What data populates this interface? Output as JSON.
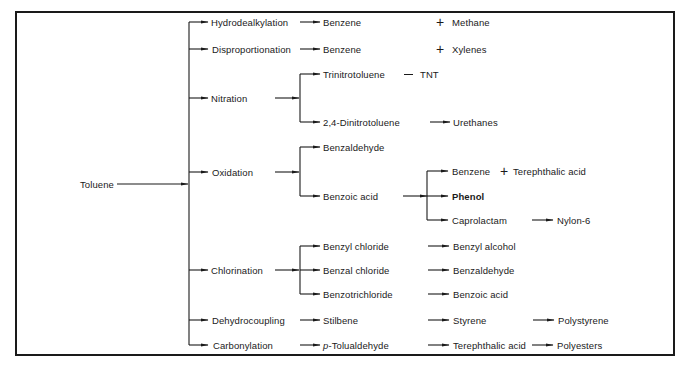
{
  "diagram": {
    "root": "Toluene",
    "processes": [
      {
        "name": "Hydrodealkylation",
        "products": [
          {
            "name": "Benzene",
            "plus": "Methane"
          }
        ]
      },
      {
        "name": "Disproportionation",
        "products": [
          {
            "name": "Benzene",
            "plus": "Xylenes"
          }
        ]
      },
      {
        "name": "Nitration",
        "products": [
          {
            "name": "Trinitrotoluene",
            "alias": "TNT"
          },
          {
            "name": "2,4-Dinitrotoluene",
            "next": [
              "Urethanes"
            ]
          }
        ]
      },
      {
        "name": "Oxidation",
        "products": [
          {
            "name": "Benzaldehyde"
          },
          {
            "name": "Benzoic acid",
            "branches": [
              {
                "name": "Benzene",
                "plus": "Terephthalic acid"
              },
              {
                "name": "Phenol"
              },
              {
                "name": "Caprolactam",
                "next": [
                  "Nylon-6"
                ]
              }
            ]
          }
        ]
      },
      {
        "name": "Chlorination",
        "products": [
          {
            "name": "Benzyl chloride",
            "next": [
              "Benzyl alcohol"
            ]
          },
          {
            "name": "Benzal chloride",
            "next": [
              "Benzaldehyde"
            ]
          },
          {
            "name": "Benzotrichloride",
            "next": [
              "Benzoic acid"
            ]
          }
        ]
      },
      {
        "name": "Dehydrocoupling",
        "products": [
          {
            "name": "Stilbene",
            "next": [
              "Styrene",
              "Polystyrene"
            ]
          }
        ]
      },
      {
        "name": "Carbonylation",
        "products": [
          {
            "name": "p-Tolualdehyde",
            "prefix_italic": "p",
            "rest": "-Tolualdehyde",
            "next": [
              "Terephthalic acid",
              "Polyesters"
            ]
          }
        ]
      }
    ]
  },
  "labels": {
    "root": "Toluene",
    "p1": "Hydrodealkylation",
    "p2": "Disproportionation",
    "p3": "Nitration",
    "p4": "Oxidation",
    "p5": "Chlorination",
    "p6": "Dehydrocoupling",
    "p7": "Carbonylation",
    "benzene_a": "Benzene",
    "methane": "Methane",
    "benzene_b": "Benzene",
    "xylenes": "Xylenes",
    "tnt_full": "Trinitrotoluene",
    "tnt": "TNT",
    "dnt": "2,4-Dinitrotoluene",
    "urethanes": "Urethanes",
    "benzaldehyde_ox": "Benzaldehyde",
    "benzoic_ox": "Benzoic acid",
    "benzene_c": "Benzene",
    "terephthalic_a": "Terephthalic acid",
    "phenol": "Phenol",
    "caprolactam": "Caprolactam",
    "nylon6": "Nylon-6",
    "benzyl_chloride": "Benzyl chloride",
    "benzyl_alcohol": "Benzyl alcohol",
    "benzal_chloride": "Benzal chloride",
    "benzaldehyde_cl": "Benzaldehyde",
    "benzotrichloride": "Benzotrichloride",
    "benzoic_cl": "Benzoic acid",
    "stilbene": "Stilbene",
    "styrene": "Styrene",
    "polystyrene": "Polystyrene",
    "p_prefix": "p",
    "tolualdehyde_rest": "-Tolualdehyde",
    "terephthalic_b": "Terephthalic acid",
    "polyesters": "Polyesters"
  },
  "symbols": {
    "plus": "+"
  },
  "colors": {
    "ink": "#1a1a1a",
    "background": "#ffffff"
  }
}
